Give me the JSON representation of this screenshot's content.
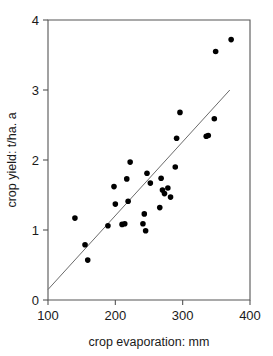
{
  "chart_data": {
    "type": "scatter",
    "title": "",
    "xlabel": "crop evaporation: mm",
    "ylabel": "crop yield: t/ha. a",
    "xlim": [
      100,
      400
    ],
    "ylim": [
      0,
      4
    ],
    "xticks": [
      100,
      200,
      300,
      400
    ],
    "yticks": [
      0,
      1,
      2,
      3,
      4
    ],
    "xtick_labels": [
      "100",
      "200",
      "300",
      "400"
    ],
    "ytick_labels": [
      "0",
      "1",
      "2",
      "3",
      "4"
    ],
    "grid": false,
    "legend": "none",
    "series": [
      {
        "name": "crop yield vs crop evaporation",
        "marker": "filled-circle",
        "color": "#000000",
        "points": [
          [
            140,
            1.17
          ],
          [
            155,
            0.79
          ],
          [
            159,
            0.57
          ],
          [
            189,
            1.06
          ],
          [
            198,
            1.62
          ],
          [
            200,
            1.37
          ],
          [
            210,
            1.08
          ],
          [
            214,
            1.09
          ],
          [
            217,
            1.73
          ],
          [
            219,
            1.41
          ],
          [
            222,
            1.97
          ],
          [
            241,
            1.09
          ],
          [
            243,
            1.23
          ],
          [
            245,
            0.99
          ],
          [
            247,
            1.81
          ],
          [
            252,
            1.67
          ],
          [
            266,
            1.32
          ],
          [
            268,
            1.74
          ],
          [
            270,
            1.57
          ],
          [
            273,
            1.52
          ],
          [
            278,
            1.6
          ],
          [
            282,
            1.47
          ],
          [
            289,
            1.9
          ],
          [
            291,
            2.31
          ],
          [
            296,
            2.68
          ],
          [
            335,
            2.34
          ],
          [
            338,
            2.35
          ],
          [
            347,
            2.59
          ],
          [
            349,
            3.55
          ],
          [
            372,
            3.72
          ]
        ]
      }
    ],
    "trend_line": {
      "name": "linear fit",
      "color": "#6b6b6b",
      "x_start": 100,
      "y_start": 0.15,
      "x_end": 370,
      "y_end": 3.0
    }
  }
}
